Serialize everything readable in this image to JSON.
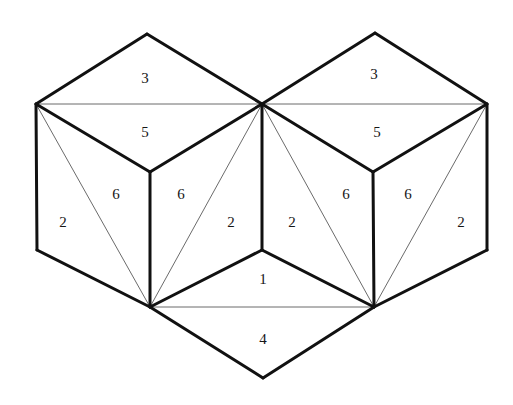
{
  "figure": {
    "background_color": "#ffffff",
    "stroke_color": "#111111",
    "thin_stroke_color": "#6b6b6b",
    "label_color": "#161616",
    "width": 513,
    "height": 405
  },
  "vertices": {
    "left_top_apex": {
      "x": 147,
      "y": 34
    },
    "left_outer_top": {
      "x": 36,
      "y": 104
    },
    "center_top": {
      "x": 262,
      "y": 104
    },
    "right_top_apex": {
      "x": 375,
      "y": 33
    },
    "right_outer_top": {
      "x": 487,
      "y": 104
    },
    "left_mid": {
      "x": 150,
      "y": 172
    },
    "right_mid": {
      "x": 373,
      "y": 172
    },
    "left_outer_bottom": {
      "x": 37,
      "y": 250
    },
    "right_outer_bottom": {
      "x": 487,
      "y": 250
    },
    "center_mid": {
      "x": 262,
      "y": 250
    },
    "left_hub": {
      "x": 150,
      "y": 307
    },
    "right_hub": {
      "x": 374,
      "y": 307
    },
    "bottom_apex": {
      "x": 263,
      "y": 378
    }
  },
  "labels": [
    {
      "id": "face-3-left",
      "text": "3",
      "x": 145,
      "y": 80
    },
    {
      "id": "face-5-left",
      "text": "5",
      "x": 145,
      "y": 134
    },
    {
      "id": "face-3-right",
      "text": "3",
      "x": 374,
      "y": 76
    },
    {
      "id": "face-5-right",
      "text": "5",
      "x": 377,
      "y": 134
    },
    {
      "id": "face-2-far-left",
      "text": "2",
      "x": 63,
      "y": 224
    },
    {
      "id": "face-6-left-a",
      "text": "6",
      "x": 116,
      "y": 196
    },
    {
      "id": "face-6-left-b",
      "text": "6",
      "x": 181,
      "y": 196
    },
    {
      "id": "face-2-inner-left",
      "text": "2",
      "x": 231,
      "y": 224
    },
    {
      "id": "face-2-inner-right",
      "text": "2",
      "x": 292,
      "y": 224
    },
    {
      "id": "face-6-right-a",
      "text": "6",
      "x": 346,
      "y": 196
    },
    {
      "id": "face-6-right-b",
      "text": "6",
      "x": 408,
      "y": 196
    },
    {
      "id": "face-2-far-right",
      "text": "2",
      "x": 461,
      "y": 224
    },
    {
      "id": "face-1-center",
      "text": "1",
      "x": 263,
      "y": 281
    },
    {
      "id": "face-4-bottom",
      "text": "4",
      "x": 263,
      "y": 341
    }
  ],
  "thick_edges": [
    {
      "id": "left-apex-to-left-outer",
      "x1": 147,
      "y1": 34,
      "x2": 36,
      "y2": 104
    },
    {
      "id": "left-apex-to-center",
      "x1": 147,
      "y1": 34,
      "x2": 262,
      "y2": 104
    },
    {
      "id": "left-outer-top-to-mid",
      "x1": 36,
      "y1": 104,
      "x2": 150,
      "y2": 172
    },
    {
      "id": "center-top-to-left-mid",
      "x1": 262,
      "y1": 104,
      "x2": 150,
      "y2": 172
    },
    {
      "id": "left-outer-vertical",
      "x1": 36,
      "y1": 104,
      "x2": 37,
      "y2": 250
    },
    {
      "id": "left-mid-vertical",
      "x1": 150,
      "y1": 172,
      "x2": 150,
      "y2": 307
    },
    {
      "id": "left-outer-bottom-to-hub",
      "x1": 37,
      "y1": 250,
      "x2": 150,
      "y2": 307
    },
    {
      "id": "center-top-vertical",
      "x1": 262,
      "y1": 104,
      "x2": 262,
      "y2": 250
    },
    {
      "id": "center-mid-to-left-hub",
      "x1": 262,
      "y1": 250,
      "x2": 150,
      "y2": 307
    },
    {
      "id": "center-mid-to-right-hub",
      "x1": 262,
      "y1": 250,
      "x2": 374,
      "y2": 307
    },
    {
      "id": "left-hub-to-bottom-apex",
      "x1": 150,
      "y1": 307,
      "x2": 263,
      "y2": 378
    },
    {
      "id": "right-hub-to-bottom-apex",
      "x1": 374,
      "y1": 307,
      "x2": 263,
      "y2": 378
    },
    {
      "id": "right-apex-to-center",
      "x1": 375,
      "y1": 33,
      "x2": 262,
      "y2": 104
    },
    {
      "id": "right-apex-to-right-outer",
      "x1": 375,
      "y1": 33,
      "x2": 487,
      "y2": 104
    },
    {
      "id": "center-top-to-right-mid",
      "x1": 262,
      "y1": 104,
      "x2": 373,
      "y2": 172
    },
    {
      "id": "right-outer-top-to-mid",
      "x1": 487,
      "y1": 104,
      "x2": 373,
      "y2": 172
    },
    {
      "id": "right-mid-vertical",
      "x1": 373,
      "y1": 172,
      "x2": 374,
      "y2": 307
    },
    {
      "id": "right-outer-vertical",
      "x1": 487,
      "y1": 104,
      "x2": 487,
      "y2": 250
    },
    {
      "id": "right-outer-bottom-to-hub",
      "x1": 487,
      "y1": 250,
      "x2": 374,
      "y2": 307
    }
  ],
  "thin_edges": [
    {
      "id": "left-top-horizontal-diagonal",
      "x1": 36,
      "y1": 104,
      "x2": 262,
      "y2": 104
    },
    {
      "id": "right-top-horizontal-diagonal",
      "x1": 262,
      "y1": 104,
      "x2": 487,
      "y2": 104
    },
    {
      "id": "left-face-diagonal",
      "x1": 36,
      "y1": 104,
      "x2": 150,
      "y2": 307
    },
    {
      "id": "left-inner-diagonal",
      "x1": 262,
      "y1": 104,
      "x2": 150,
      "y2": 307
    },
    {
      "id": "right-inner-diagonal",
      "x1": 262,
      "y1": 104,
      "x2": 374,
      "y2": 307
    },
    {
      "id": "right-face-diagonal",
      "x1": 487,
      "y1": 104,
      "x2": 374,
      "y2": 307
    },
    {
      "id": "bottom-horizontal-diagonal",
      "x1": 150,
      "y1": 307,
      "x2": 374,
      "y2": 307
    }
  ]
}
